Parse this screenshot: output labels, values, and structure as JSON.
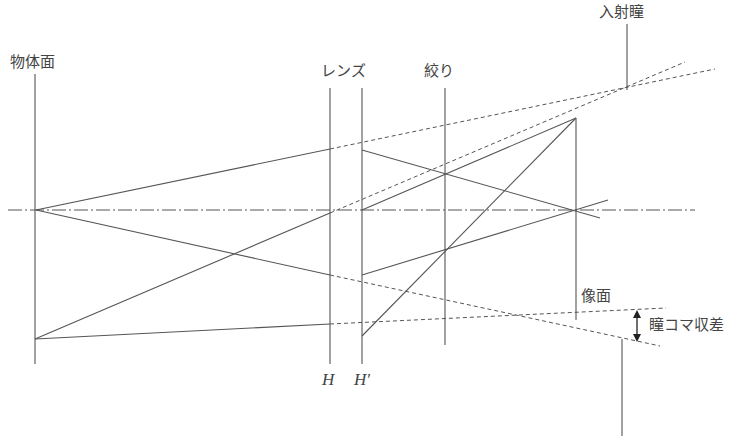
{
  "labels": {
    "object_plane": "物体面",
    "lens": "レンズ",
    "stop": "絞り",
    "entrance_pupil": "入射瞳",
    "image_plane": "像面",
    "pupil_coma": "瞳コマ収差",
    "principal_plane_h": "H",
    "principal_plane_h_prime": "H′"
  },
  "colors": {
    "line": "#555555",
    "text": "#444444",
    "background": "#ffffff"
  },
  "geometry": {
    "optical_axis_y": 210,
    "object_plane_x": 35,
    "lens_h_x": 330,
    "lens_h_prime_x": 362,
    "stop_x": 445,
    "image_plane_x": 576,
    "entrance_pupil_x": 627
  }
}
